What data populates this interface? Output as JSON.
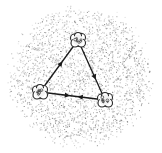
{
  "diagram": {
    "type": "triangle-cycle",
    "background": {
      "color": "#ffffff",
      "speckle_color": "#9a9a9a",
      "blob_center": [
        80,
        76
      ],
      "blob_radius": [
        72,
        70
      ]
    },
    "nodes": [
      {
        "id": "top",
        "x": 78,
        "y": 40
      },
      {
        "id": "bottom-left",
        "x": 40,
        "y": 92
      },
      {
        "id": "bottom-right",
        "x": 105,
        "y": 100
      }
    ],
    "edges": [
      {
        "from": "bottom-left",
        "to": "top",
        "arrow_at": 0.55
      },
      {
        "from": "top",
        "to": "bottom-right",
        "arrow_at": 0.62
      },
      {
        "from": "bottom-left",
        "to": "bottom-right",
        "arrow_at": 0.42
      },
      {
        "from": "bottom-right",
        "to": "bottom-left",
        "arrow_at": 0.38
      }
    ],
    "line_color": "#1a1a1a",
    "node_color": "#2a2a2a"
  }
}
